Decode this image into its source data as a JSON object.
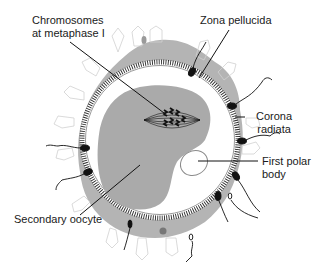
{
  "diagram": {
    "colors": {
      "corona_gray": "#b4b4b4",
      "cell_outline": "#c8c8c8",
      "zona_white": "#ffffff",
      "zona_stripes": "#2a2a2a",
      "oocyte_gray": "#aaaaaa",
      "ink": "#111111"
    },
    "labels": {
      "chromosomes": "Chromosomes\nat metaphase I",
      "zona_pellucida": "Zona pellucida",
      "corona_radiata": "Corona\nradiata",
      "first_polar_body": "First polar\nbody",
      "secondary_oocyte": "Secondary oocyte"
    }
  }
}
